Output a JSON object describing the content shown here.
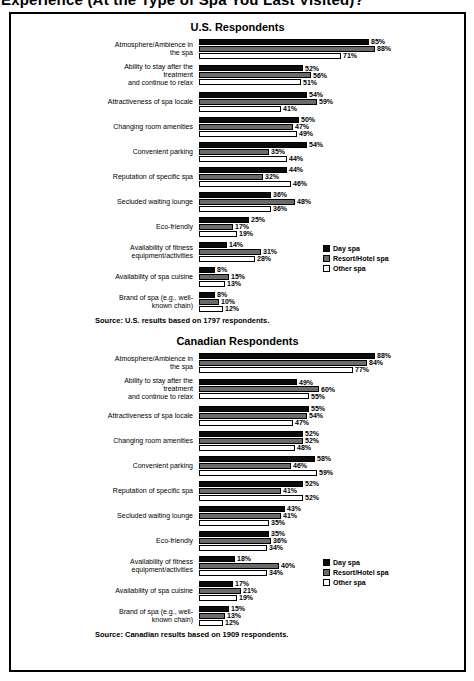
{
  "page_title": "Experience (At the Type of Spa You Last Visited)?",
  "colors": {
    "bar_border": "#000000",
    "day_spa": "#0b0b0b",
    "resort_hotel_spa": "#6b6b6b",
    "other_spa": "#ffffff"
  },
  "legend": {
    "items": [
      {
        "label": "Day spa",
        "color": "#0b0b0b"
      },
      {
        "label": "Resort/Hotel spa",
        "color": "#6b6b6b"
      },
      {
        "label": "Other spa",
        "color": "#ffffff"
      }
    ]
  },
  "chart_data": [
    {
      "type": "bar",
      "orientation": "horizontal",
      "title": "U.S. Respondents",
      "value_suffix": "%",
      "xlim": [
        0,
        100
      ],
      "grid": false,
      "legend_position": "right",
      "source": "Source: U.S. results based on 1797 respondents.",
      "categories": [
        "Atmosphere/Ambience in\nthe spa",
        "Ability to stay after the\ntreatment\nand continue to relax",
        "Attractiveness of spa locale",
        "Changing room amenities",
        "Convenient parking",
        "Reputation of specific spa",
        "Secluded waiting lounge",
        "Eco-friendly",
        "Availability of fitness\nequipment/activities",
        "Availability of spa cuisine",
        "Brand of spa (e.g., well-\nknown chain)"
      ],
      "series": [
        {
          "name": "Day spa",
          "values": [
            85,
            52,
            54,
            50,
            54,
            44,
            36,
            25,
            14,
            8,
            8
          ]
        },
        {
          "name": "Resort/Hotel spa",
          "values": [
            88,
            56,
            59,
            47,
            35,
            32,
            48,
            17,
            31,
            15,
            10
          ]
        },
        {
          "name": "Other spa",
          "values": [
            71,
            51,
            41,
            49,
            44,
            46,
            36,
            19,
            28,
            13,
            12
          ]
        }
      ]
    },
    {
      "type": "bar",
      "orientation": "horizontal",
      "title": "Canadian Respondents",
      "value_suffix": "%",
      "xlim": [
        0,
        100
      ],
      "grid": false,
      "legend_position": "right",
      "source": "Source: Canadian results based on 1909 respondents.",
      "categories": [
        "Atmosphere/Ambience in\nthe spa",
        "Ability to stay after the\ntreatment\nand continue to relax",
        "Attractiveness of spa locale",
        "Changing room amenities",
        "Convenient parking",
        "Reputation of specific spa",
        "Secluded waiting lounge",
        "Eco-friendly",
        "Availability of fitness\nequipment/activities",
        "Availability of spa cuisine",
        "Brand of spa (e.g., well-\nknown chain)"
      ],
      "series": [
        {
          "name": "Day spa",
          "values": [
            88,
            49,
            55,
            52,
            58,
            52,
            43,
            35,
            18,
            17,
            15
          ]
        },
        {
          "name": "Resort/Hotel spa",
          "values": [
            84,
            60,
            54,
            52,
            46,
            41,
            41,
            36,
            40,
            21,
            13
          ]
        },
        {
          "name": "Other spa",
          "values": [
            77,
            55,
            47,
            48,
            59,
            52,
            35,
            34,
            34,
            19,
            12
          ]
        }
      ]
    }
  ]
}
